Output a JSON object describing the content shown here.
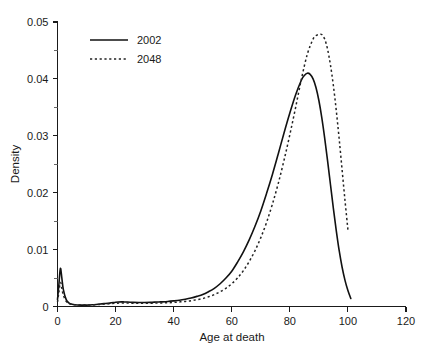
{
  "chart_data": {
    "type": "line",
    "title": "",
    "subtitle": "",
    "xlabel": "Age at death",
    "ylabel": "Density",
    "xlim": [
      0,
      120
    ],
    "ylim": [
      0,
      0.05
    ],
    "grid": false,
    "legend_position": "top-left",
    "xticks": [
      0,
      20,
      40,
      60,
      80,
      100,
      120
    ],
    "xtick_labels": [
      "0",
      "20",
      "40",
      "60",
      "80",
      "100",
      "120"
    ],
    "yticks": [
      0,
      0.01,
      0.02,
      0.03,
      0.04,
      0.05
    ],
    "ytick_labels": [
      "0",
      "0.01",
      "0.02",
      "0.03",
      "0.04",
      "0.05"
    ],
    "yminor_ticks": [
      0.005,
      0.015,
      0.025,
      0.035,
      0.045
    ],
    "series": [
      {
        "name": "2002",
        "style": "solid",
        "color": "#111111",
        "peak_x": 86,
        "peak_y": 0.041,
        "x": [
          0,
          0.5,
          1,
          1.5,
          2,
          3,
          4,
          5,
          6,
          8,
          10,
          12,
          14,
          16,
          18,
          20,
          21,
          22,
          23,
          24,
          25,
          26,
          28,
          30,
          32,
          34,
          35,
          36,
          38,
          40,
          42,
          44,
          46,
          48,
          50,
          52,
          54,
          56,
          58,
          60,
          62,
          64,
          66,
          68,
          70,
          72,
          74,
          76,
          78,
          80,
          82,
          84,
          85,
          86,
          87,
          88,
          89,
          90,
          91,
          92,
          93,
          94,
          95,
          96,
          97,
          98,
          99,
          100,
          101
        ],
        "y": [
          0.0012,
          0.004,
          0.0067,
          0.005,
          0.003,
          0.0012,
          0.0006,
          0.0004,
          0.0003,
          0.00025,
          0.00025,
          0.0003,
          0.0004,
          0.0005,
          0.0006,
          0.00075,
          0.0008,
          0.00082,
          0.0008,
          0.00078,
          0.00075,
          0.00072,
          0.0007,
          0.0007,
          0.00072,
          0.00078,
          0.0008,
          0.00082,
          0.00088,
          0.00098,
          0.0011,
          0.00128,
          0.0015,
          0.00178,
          0.0021,
          0.0026,
          0.0032,
          0.004,
          0.005,
          0.0062,
          0.0078,
          0.0096,
          0.0117,
          0.0141,
          0.0168,
          0.0199,
          0.0232,
          0.0268,
          0.0305,
          0.034,
          0.0372,
          0.0398,
          0.0406,
          0.041,
          0.0408,
          0.04,
          0.0385,
          0.0362,
          0.0332,
          0.0296,
          0.0256,
          0.0214,
          0.0172,
          0.0133,
          0.0098,
          0.0069,
          0.0046,
          0.0028,
          0.0014
        ]
      },
      {
        "name": "2048",
        "style": "dotted",
        "color": "#222222",
        "peak_x": 91,
        "peak_y": 0.0478,
        "end_x": 100,
        "end_y": 0.0135,
        "x": [
          0,
          0.5,
          1,
          1.5,
          2,
          3,
          4,
          5,
          6,
          8,
          10,
          12,
          14,
          16,
          18,
          20,
          22,
          24,
          26,
          28,
          30,
          32,
          34,
          36,
          38,
          40,
          42,
          44,
          46,
          48,
          50,
          52,
          54,
          56,
          58,
          60,
          62,
          64,
          66,
          68,
          70,
          72,
          74,
          76,
          78,
          80,
          82,
          84,
          86,
          88,
          89,
          90,
          91,
          92,
          93,
          94,
          95,
          96,
          97,
          98,
          99,
          100
        ],
        "y": [
          0.0008,
          0.0026,
          0.0042,
          0.0032,
          0.002,
          0.0009,
          0.0005,
          0.00035,
          0.0003,
          0.00025,
          0.00025,
          0.0003,
          0.00035,
          0.00042,
          0.0005,
          0.00058,
          0.0006,
          0.0006,
          0.00058,
          0.00056,
          0.00056,
          0.00058,
          0.0006,
          0.00062,
          0.00066,
          0.00072,
          0.0008,
          0.0009,
          0.00102,
          0.0012,
          0.0014,
          0.0017,
          0.0021,
          0.0026,
          0.0032,
          0.004,
          0.005,
          0.0063,
          0.0079,
          0.0098,
          0.0121,
          0.0148,
          0.018,
          0.0216,
          0.0257,
          0.0302,
          0.035,
          0.04,
          0.0443,
          0.047,
          0.0476,
          0.0478,
          0.0478,
          0.047,
          0.0452,
          0.0424,
          0.0388,
          0.0344,
          0.0294,
          0.024,
          0.0186,
          0.0135
        ]
      }
    ]
  },
  "legend": {
    "entries": [
      {
        "label": "2002"
      },
      {
        "label": "2048"
      }
    ]
  },
  "axes": {
    "x_title": "Age at death",
    "y_title": "Density"
  }
}
